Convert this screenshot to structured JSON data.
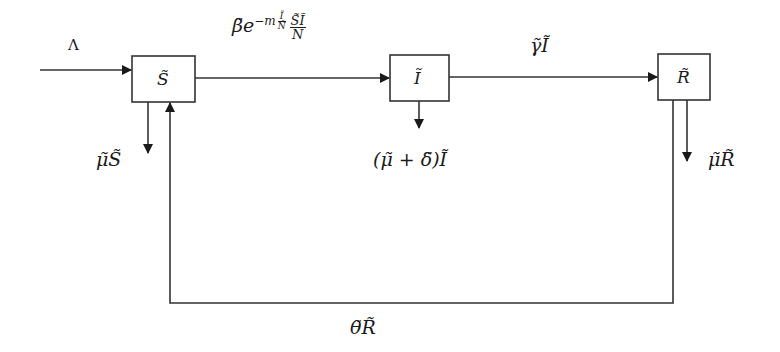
{
  "diagram": {
    "type": "compartmental-model-flow-diagram",
    "compartments": [
      {
        "id": "S",
        "label": "S̃"
      },
      {
        "id": "I",
        "label": "Ĩ"
      },
      {
        "id": "R",
        "label": "R̃"
      }
    ],
    "flows": {
      "recruitment": {
        "label": "Λ"
      },
      "infection": {
        "coef": "β̃",
        "e": "e",
        "exp_prefix": "−m",
        "exp_frac_num": "Ĩ",
        "exp_frac_den": "Ñ",
        "frac_num": "S̃Ĩ",
        "frac_den": "Ñ"
      },
      "recovery": {
        "label": "γ̃Ĩ"
      },
      "death_S": {
        "label": "μ̃S̃"
      },
      "death_I": {
        "label": "(μ̃ + δ̃)Ĩ"
      },
      "death_R": {
        "label": "μ̃R̃"
      },
      "loss_of_immunity": {
        "label": "θ̃R̃"
      }
    },
    "colors": {
      "stroke": "#333333",
      "background": "#ffffff"
    }
  }
}
